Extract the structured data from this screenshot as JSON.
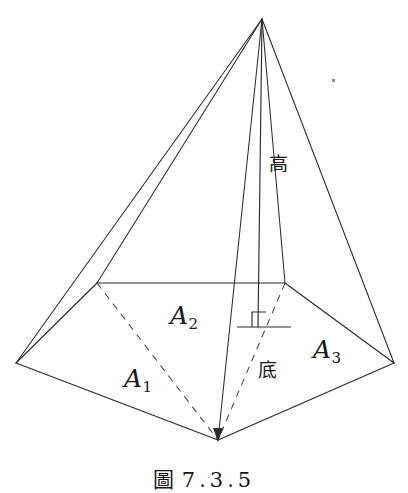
{
  "figure": {
    "caption_prefix": "圖",
    "caption_number": "7.3.5",
    "caption_full": "圖 7.3.5",
    "line_color": "#2b2b2b",
    "background_color": "#ffffff",
    "width": 408,
    "height": 489
  },
  "labels": {
    "height": "高",
    "base": "底",
    "face_left": {
      "letter": "A",
      "subscript": "1",
      "text": "A1"
    },
    "face_middle": {
      "letter": "A",
      "subscript": "2",
      "text": "A2"
    },
    "face_right": {
      "letter": "A",
      "subscript": "3",
      "text": "A3"
    }
  },
  "geometry": {
    "apex": [
      262,
      19
    ],
    "base_vertices": {
      "back_left": [
        97,
        283
      ],
      "back_right": [
        285,
        283
      ],
      "left": [
        16,
        363
      ],
      "right": [
        394,
        363
      ],
      "front": [
        218,
        440
      ]
    },
    "height_foot": [
      258,
      327
    ],
    "right_angle_marker": {
      "x": 252,
      "y": 311,
      "size": 15
    },
    "ground_tick": {
      "x1": 237,
      "x2": 291,
      "y": 327
    },
    "solid_edges": [
      "apex-left",
      "apex-back_left",
      "apex-front",
      "apex-right",
      "back_left-back_right",
      "left-front",
      "front-right",
      "left-back_left",
      "right-back_right"
    ],
    "dashed_edges": [
      "back_left-front",
      "back_right-front"
    ],
    "height_line": "apex-height_foot"
  }
}
